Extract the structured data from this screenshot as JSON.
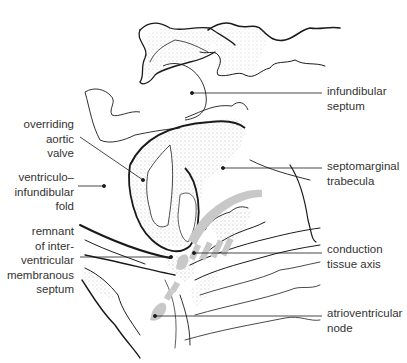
{
  "diagram": {
    "type": "anatomical line drawing",
    "colors": {
      "line": "#1a1a1a",
      "conduction_tissue": "#c8c8c8",
      "stipple": "#555555",
      "text": "#333333"
    },
    "labels_left": [
      {
        "id": "overriding-aortic-valve",
        "lines": [
          "overriding",
          "aortic",
          "valve"
        ]
      },
      {
        "id": "ventriculo-infundibular-fold",
        "lines": [
          "ventriculo–",
          "infundibular",
          "fold"
        ]
      },
      {
        "id": "remnant-membranous-septum",
        "lines": [
          "remnant",
          "of inter-",
          "ventricular",
          "membranous",
          "septum"
        ]
      }
    ],
    "labels_right": [
      {
        "id": "infundibular-septum",
        "lines": [
          "infundibular",
          "septum"
        ]
      },
      {
        "id": "septomarginal-trabecula",
        "lines": [
          "septomarginal",
          "trabecula"
        ]
      },
      {
        "id": "conduction-tissue-axis",
        "lines": [
          "conduction",
          "tissue axis"
        ]
      },
      {
        "id": "atrioventricular-node",
        "lines": [
          "atrioventricular",
          "node"
        ]
      }
    ]
  }
}
